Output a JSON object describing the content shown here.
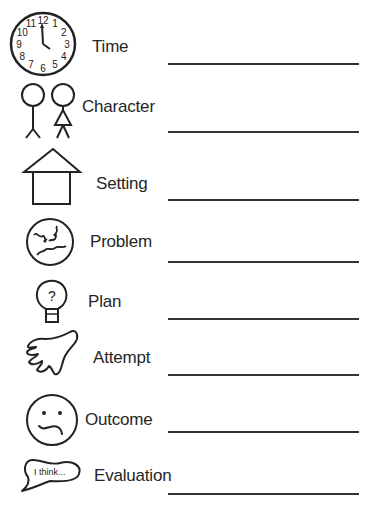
{
  "worksheet": {
    "rows": [
      {
        "id": "time",
        "label": "Time",
        "icon": "clock-icon"
      },
      {
        "id": "character",
        "label": "Character",
        "icon": "stick-figures-icon"
      },
      {
        "id": "setting",
        "label": "Setting",
        "icon": "house-icon"
      },
      {
        "id": "problem",
        "label": "Problem",
        "icon": "angry-face-icon"
      },
      {
        "id": "plan",
        "label": "Plan",
        "icon": "lightbulb-question-icon"
      },
      {
        "id": "attempt",
        "label": "Attempt",
        "icon": "hand-icon"
      },
      {
        "id": "outcome",
        "label": "Outcome",
        "icon": "confused-face-icon"
      },
      {
        "id": "evaluation",
        "label": "Evaluation",
        "icon": "speech-bubble-icon"
      }
    ],
    "clock_numbers": [
      "12",
      "1",
      "2",
      "3",
      "4",
      "5",
      "6",
      "7",
      "8",
      "9",
      "10",
      "11"
    ],
    "bubble_text": "I think..."
  }
}
